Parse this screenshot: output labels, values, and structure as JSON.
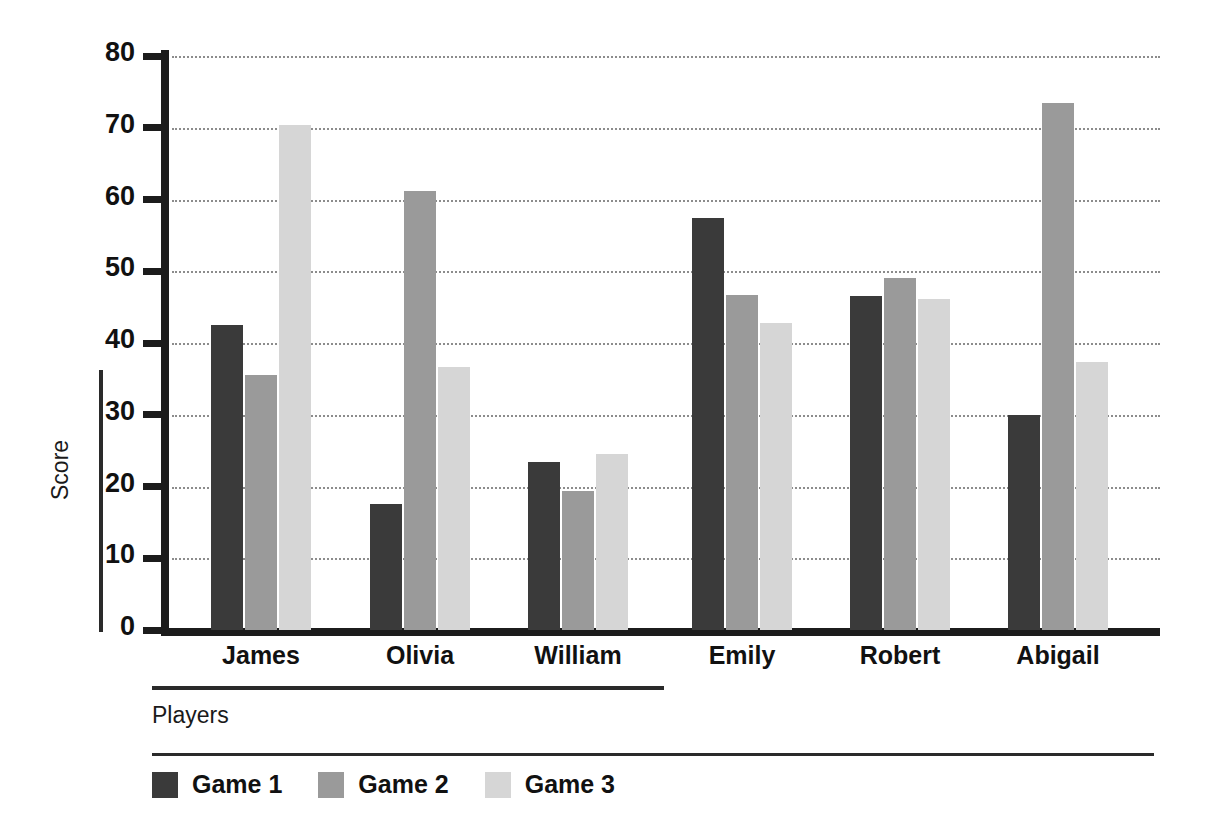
{
  "chart_data": {
    "type": "bar",
    "title": "",
    "xlabel": "Players",
    "ylabel": "Score",
    "categories": [
      "James",
      "Olivia",
      "William",
      "Emily",
      "Robert",
      "Abigail"
    ],
    "series": [
      {
        "name": "Game 1",
        "color": "#3a3a3a",
        "values": [
          42.5,
          17.5,
          23.4,
          57.4,
          46.6,
          30.0
        ]
      },
      {
        "name": "Game 2",
        "color": "#9a9a9a",
        "values": [
          35.5,
          61.2,
          19.4,
          46.7,
          49.1,
          73.5
        ]
      },
      {
        "name": "Game 3",
        "color": "#d6d6d6",
        "values": [
          70.4,
          36.7,
          24.5,
          42.8,
          46.1,
          37.3
        ]
      }
    ],
    "ylim": [
      0,
      80
    ],
    "ytick_labels": [
      "0",
      "10",
      "20",
      "30",
      "40",
      "50",
      "60",
      "70",
      "80"
    ],
    "ytick_values": [
      0,
      10,
      20,
      30,
      40,
      50,
      60,
      70,
      80
    ],
    "grid": true,
    "grid_style": "dotted",
    "legend_position": "bottom",
    "axis_color": "#1c1c1c",
    "background": "#ffffff"
  },
  "legend": {
    "items": [
      {
        "label": "Game 1"
      },
      {
        "label": "Game 2"
      },
      {
        "label": "Game 3"
      }
    ]
  }
}
